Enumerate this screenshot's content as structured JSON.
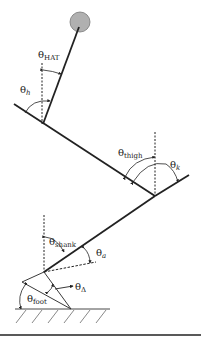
{
  "diagram": {
    "type": "biomechanical segment-angle diagram",
    "labels": {
      "hat": {
        "symbol": "θ",
        "sub": "HAT"
      },
      "h": {
        "symbol": "θ",
        "sub": "h"
      },
      "thigh": {
        "symbol": "θ",
        "sub": "thigh"
      },
      "k": {
        "symbol": "θ",
        "sub": "k"
      },
      "shank": {
        "symbol": "θ",
        "sub": "shank"
      },
      "a": {
        "symbol": "θ",
        "sub": "a"
      },
      "delta": {
        "symbol": "θ",
        "sub": "Δ"
      },
      "foot": {
        "symbol": "θ",
        "sub": "foot"
      }
    },
    "colors": {
      "line": "#222222",
      "head_fill": "#b0b0b0",
      "head_stroke": "#777777"
    }
  }
}
